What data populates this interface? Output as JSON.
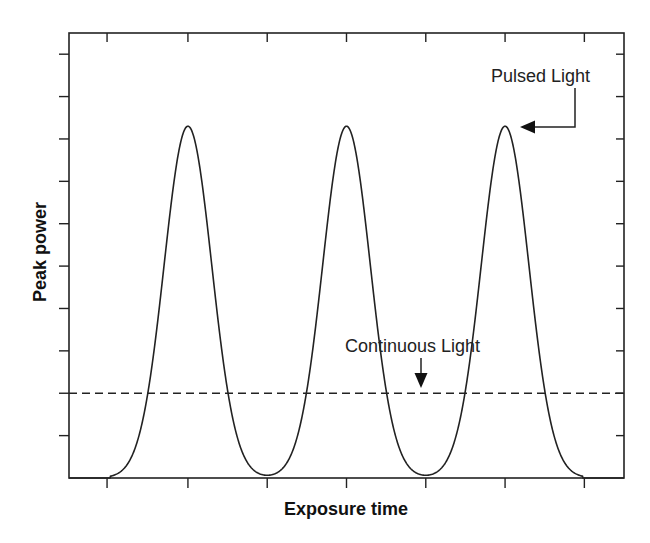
{
  "chart_data": {
    "type": "line",
    "title": "",
    "xlabel": "Exposure time",
    "ylabel": "Peak power",
    "x_tick_labels": [],
    "y_tick_labels": [],
    "grid": false,
    "legend": null,
    "xlim": [
      0,
      7
    ],
    "ylim": [
      0,
      10.5
    ],
    "x_ticks": [
      0.48,
      1.5,
      2.5,
      3.5,
      4.5,
      5.5,
      6.5
    ],
    "y_ticks": [
      1,
      2,
      3,
      4,
      5,
      6,
      7,
      8,
      9,
      10
    ],
    "series": [
      {
        "name": "Pulsed Light",
        "style": "solid",
        "shape": "gaussian pulses",
        "peaks_x": [
          1.5,
          3.5,
          5.5
        ],
        "peak_value": 8.3,
        "baseline_value": 0,
        "sigma": 0.3
      },
      {
        "name": "Continuous Light",
        "style": "dashed",
        "value": 2.0
      }
    ],
    "annotations": [
      {
        "text": "Pulsed Light",
        "arrow": "left",
        "points_to": "third peak"
      },
      {
        "text": "Continuous Light",
        "arrow": "down",
        "points_to": "dashed line"
      }
    ]
  },
  "labels": {
    "xlabel": "Exposure time",
    "ylabel": "Peak power",
    "pulsed": "Pulsed Light",
    "continuous": "Continuous Light"
  },
  "colors": {
    "stroke": "#1a1a1a",
    "background": "#ffffff"
  }
}
